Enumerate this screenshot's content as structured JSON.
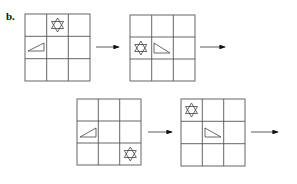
{
  "figure": {
    "label": "b.",
    "grids": [
      {
        "id": 1,
        "star": [
          0,
          1
        ],
        "triangle": [
          1,
          0
        ],
        "triangle_orientation": "rising-right"
      },
      {
        "id": 2,
        "star": [
          1,
          0
        ],
        "triangle": [
          1,
          1
        ],
        "triangle_orientation": "falling-right"
      },
      {
        "id": 3,
        "star": [
          2,
          2
        ],
        "triangle": [
          1,
          0
        ],
        "triangle_orientation": "rising-right"
      },
      {
        "id": 4,
        "star": [
          0,
          0
        ],
        "triangle": [
          1,
          1
        ],
        "triangle_orientation": "falling-right"
      }
    ],
    "arrows": 4,
    "colors": {
      "line": "#555555",
      "shape": "#444444",
      "background": "#ffffff"
    }
  }
}
